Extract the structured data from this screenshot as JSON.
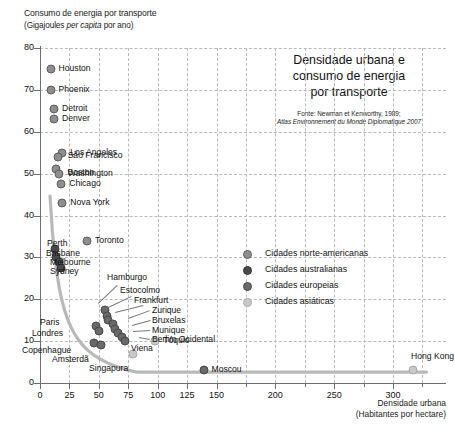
{
  "heading": {
    "line1": "Densidade urbana e",
    "line2": "consumo de energia",
    "line3": "por transporte",
    "source_line1": "Fonte: Newman et Kenworthy, 1989;",
    "source_line2": "Atlas Environnement du Monde Diplomatique 2007"
  },
  "axes": {
    "y_title_line1": "Consumo de energia por transporte",
    "y_title_line2_a": "(Gigajoules ",
    "y_title_line2_b": "per capita",
    "y_title_line2_c": " por ano)",
    "x_title_line1": "Densidade urbana",
    "x_title_line2": "(Habitantes por hectare)"
  },
  "legend": {
    "items": [
      {
        "label": "Cidades norte-americanas",
        "color": "#8e8e8e",
        "key": "na"
      },
      {
        "label": "Cidades australianas",
        "color": "#4a4a4a",
        "key": "au"
      },
      {
        "label": "Cidades europeias",
        "color": "#6a6a6a",
        "key": "eu"
      },
      {
        "label": "Cidades asiáticas",
        "color": "#c8c8c8",
        "key": "as"
      }
    ]
  },
  "chart_data": {
    "type": "scatter",
    "title": "Densidade urbana e consumo de energia por transporte",
    "xlabel": "Densidade urbana (Habitantes por hectare)",
    "ylabel": "Consumo de energia por transporte (Gigajoules per capita por ano)",
    "xlim": [
      0,
      345
    ],
    "ylim": [
      0,
      80
    ],
    "xticks": [
      0,
      25,
      50,
      75,
      100,
      125,
      150,
      200,
      250,
      300
    ],
    "yticks": [
      0,
      10,
      20,
      30,
      40,
      50,
      60,
      70,
      80
    ],
    "grid": "dashed",
    "legend_position": "right-middle",
    "series": [
      {
        "name": "Cidades norte-americanas",
        "key": "na",
        "color": "#8e8e8e",
        "points": [
          {
            "city": "Houston",
            "x": 9,
            "y": 75.0,
            "label_dx": 8,
            "label_dy": -3
          },
          {
            "city": "Phoenix",
            "x": 9,
            "y": 70.0,
            "label_dx": 8,
            "label_dy": -3
          },
          {
            "city": "Detroit",
            "x": 12,
            "y": 65.5,
            "label_dx": 8,
            "label_dy": -3
          },
          {
            "city": "Denver",
            "x": 12,
            "y": 63.0,
            "label_dx": 8,
            "label_dy": -3
          },
          {
            "city": "Los Angeles",
            "x": 19,
            "y": 55.0,
            "label_dx": 8,
            "label_dy": -3
          },
          {
            "city": "São Francisco",
            "x": 15,
            "y": 54.0,
            "label_dx": 10,
            "label_dy": -4
          },
          {
            "city": "Boston",
            "x": 14,
            "y": 51.0,
            "label_dx": 11,
            "label_dy": 1
          },
          {
            "city": "Washington",
            "x": 16,
            "y": 50.0,
            "label_dx": 9,
            "label_dy": -3
          },
          {
            "city": "Chicago",
            "x": 18,
            "y": 47.5,
            "label_dx": 8,
            "label_dy": -3
          },
          {
            "city": "Nova York",
            "x": 19,
            "y": 43.0,
            "label_dx": 8,
            "label_dy": -3
          },
          {
            "city": "Toronto",
            "x": 40,
            "y": 34.0,
            "label_dx": 8,
            "label_dy": -3
          }
        ]
      },
      {
        "name": "Cidades australianas",
        "key": "au",
        "points": [
          {
            "city": "Perth",
            "x": 13,
            "y": 32.0,
            "label_dx": 11,
            "label_dy": -3
          },
          {
            "city": "Brisbane",
            "x": 14,
            "y": 30.0,
            "label_dx": 12,
            "label_dy": -3
          },
          {
            "city": "Melbourne",
            "x": 16,
            "y": 29.0,
            "label_dx": 13,
            "label_dy": -3
          },
          {
            "city": "Sydney",
            "x": 18,
            "y": 27.5,
            "label_dx": 13,
            "label_dy": -3
          }
        ]
      },
      {
        "name": "Cidades europeias",
        "key": "eu",
        "points": [
          {
            "city": "Hamburgo",
            "x": 55,
            "y": 17.5,
            "label_dx": 0,
            "label_dy": 0
          },
          {
            "city": "Estocolmo",
            "x": 57,
            "y": 16.0,
            "label_dx": 0,
            "label_dy": 0
          },
          {
            "city": "Frankfurt",
            "x": 58,
            "y": 15.0,
            "label_dx": 0,
            "label_dy": 0
          },
          {
            "city": "Zurique",
            "x": 62,
            "y": 14.0,
            "label_dx": 0,
            "label_dy": 0
          },
          {
            "city": "Bruxelas",
            "x": 64,
            "y": 13.0,
            "label_dx": 0,
            "label_dy": 0
          },
          {
            "city": "Munique",
            "x": 66,
            "y": 12.0,
            "label_dx": 0,
            "label_dy": 0
          },
          {
            "city": "Berlim Ocidental",
            "x": 70,
            "y": 11.0,
            "label_dx": 0,
            "label_dy": 0
          },
          {
            "city": "Viena",
            "x": 72,
            "y": 10.0,
            "label_dx": 0,
            "label_dy": 0
          },
          {
            "city": "Paris",
            "x": 48,
            "y": 13.5,
            "label_dx": 0,
            "label_dy": 0
          },
          {
            "city": "Londres",
            "x": 50,
            "y": 12.5,
            "label_dx": 0,
            "label_dy": 0
          },
          {
            "city": "Copenhague",
            "x": 46,
            "y": 9.5,
            "label_dx": 0,
            "label_dy": 0
          },
          {
            "city": "Amsterdã",
            "x": 52,
            "y": 9.0,
            "label_dx": 0,
            "label_dy": 0
          },
          {
            "city": "Moscou",
            "x": 139,
            "y": 3.0,
            "label_dx": 8,
            "label_dy": -3
          }
        ]
      },
      {
        "name": "Cidades asiáticas",
        "key": "as",
        "points": [
          {
            "city": "Tóquio",
            "x": 98,
            "y": 10.0,
            "label_dx": 8,
            "label_dy": -3
          },
          {
            "city": "Singapura",
            "x": 79,
            "y": 7.0,
            "label_dx": 0,
            "label_dy": 0
          },
          {
            "city": "Hong Kong",
            "x": 317,
            "y": 3.0,
            "label_dx": -2,
            "label_dy": -16
          }
        ]
      }
    ],
    "trend": {
      "description": "Curva de tendência hiperbólica decrescente",
      "color": "#b5b5b5"
    }
  }
}
